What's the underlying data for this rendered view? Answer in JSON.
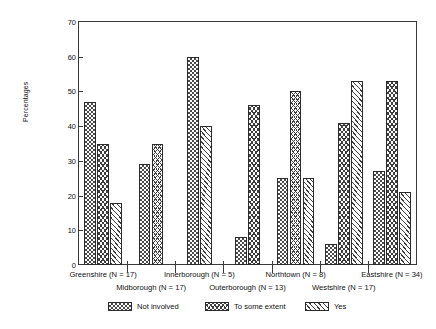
{
  "chart_data": {
    "type": "bar",
    "title": "",
    "subtitle": "",
    "xlabel": "",
    "ylabel": "Percentages",
    "ylim": [
      0,
      70
    ],
    "yticks": [
      0,
      10,
      20,
      30,
      40,
      50,
      60,
      70
    ],
    "ytick_labels": [
      "0",
      "10",
      "20",
      "30",
      "40",
      "50",
      "60",
      "70"
    ],
    "grid": false,
    "legend_position": "bottom",
    "categories": [
      "Greenshire (N = 17)",
      "Midborough (N = 17)",
      "Innerborough (N = 5)",
      "Outerborough (N = 13)",
      "Northtown (N = 8)",
      "Westshire (N = 17)",
      "Eastshire (N = 34)"
    ],
    "series": [
      {
        "name": "Not involved",
        "values": [
          47,
          29,
          60,
          8,
          25,
          6,
          27
        ]
      },
      {
        "name": "To some extent",
        "values": [
          35,
          35,
          null,
          46,
          50,
          41,
          53
        ]
      },
      {
        "name": "Yes",
        "values": [
          18,
          null,
          40,
          null,
          25,
          53,
          21
        ]
      }
    ],
    "patterns": [
      "checker",
      "chevron",
      "diag"
    ]
  },
  "axis": {
    "y_label": "Percentages",
    "y_ticks": [
      "0",
      "10",
      "20",
      "30",
      "40",
      "50",
      "60",
      "70"
    ]
  },
  "groups": [
    {
      "label": "Greenshire (N = 17)",
      "row": 0
    },
    {
      "label": "Midborough (N = 17)",
      "row": 1
    },
    {
      "label": "Innerborough (N = 5)",
      "row": 0
    },
    {
      "label": "Outerborough (N = 13)",
      "row": 1
    },
    {
      "label": "Northtown (N = 8)",
      "row": 0
    },
    {
      "label": "Westshire (N = 17)",
      "row": 1
    },
    {
      "label": "Eastshire (N = 34)",
      "row": 0
    }
  ],
  "legend": {
    "items": [
      {
        "label": "Not involved",
        "pattern": "checker"
      },
      {
        "label": "To some extent",
        "pattern": "chevron"
      },
      {
        "label": "Yes",
        "pattern": "diag"
      }
    ]
  }
}
